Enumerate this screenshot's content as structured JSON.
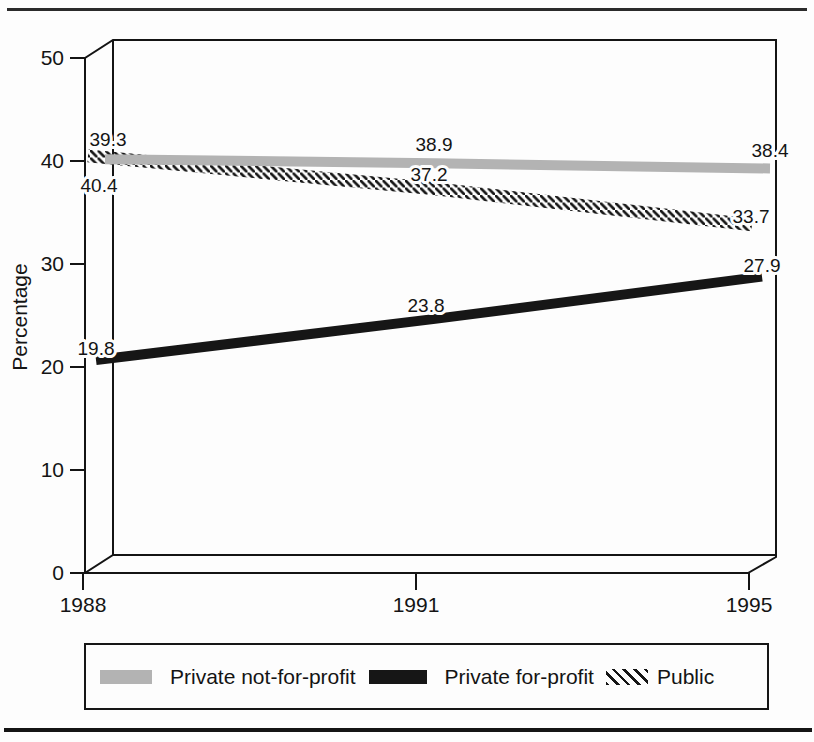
{
  "chart_data": {
    "type": "line",
    "title": "",
    "xlabel": "",
    "ylabel": "Percentage",
    "categories": [
      "1988",
      "1991",
      "1995"
    ],
    "ylim": [
      0,
      50
    ],
    "yticks": [
      "0",
      "10",
      "20",
      "30",
      "40",
      "50"
    ],
    "grid": false,
    "effect": "pseudo-3d-box",
    "legend_position": "bottom-box",
    "series": [
      {
        "name": "Private not-for-profit",
        "style": "solid",
        "color": "#b3b3b3",
        "values": [
          39.3,
          38.9,
          38.4
        ],
        "point_labels": [
          "39.3",
          "38.9",
          "38.4"
        ]
      },
      {
        "name": "Private for-profit",
        "style": "solid",
        "color": "#161616",
        "values": [
          19.8,
          23.8,
          27.9
        ],
        "point_labels": [
          "19.8",
          "23.8",
          "27.9"
        ]
      },
      {
        "name": "Public",
        "style": "hatched",
        "color": "#161616",
        "values": [
          40.4,
          37.2,
          33.7
        ],
        "point_labels": [
          "40.4",
          "37.2",
          "33.7"
        ]
      }
    ]
  }
}
